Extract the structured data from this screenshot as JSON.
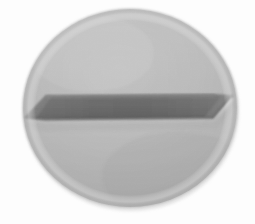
{
  "image": {
    "kind": "photograph",
    "subject": "slotted-screw-head",
    "view": "top-down",
    "width": 255,
    "height": 224,
    "background_color": "#fdfdfd",
    "colors": {
      "background": "#fdfdfd",
      "head_light": "#c2c2c2",
      "head_mid": "#b4b4b4",
      "head_shadow": "#a6a6a6",
      "head_rim": "#9e9e9e",
      "slot_dark": "#5b5b5b",
      "slot_darkest": "#4d4d4d",
      "slot_face": "#6a6a6a",
      "slot_edge_line": "#3f3f3f",
      "slot_highlight": "#d2d2d2"
    },
    "head": {
      "shape": "ellipse",
      "center_x": 130,
      "center_y": 108,
      "radius_x": 107,
      "radius_y": 99,
      "label": "screw-head-disc"
    },
    "slot": {
      "shape": "tapered-bar",
      "left_x": 24,
      "right_x": 234,
      "top_y": 94,
      "bottom_y": 119,
      "label": "screw-driver-slot",
      "description": "dark horizontal recessed slot with chamfered triangular ends"
    }
  }
}
